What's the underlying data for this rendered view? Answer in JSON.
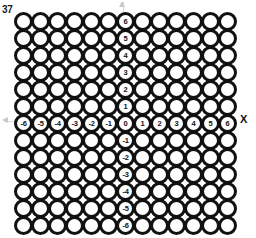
{
  "problem": {
    "number": "37"
  },
  "axes": {
    "x_label": "X",
    "y_label": "Y",
    "x_ticks": [
      "-6",
      "-5",
      "-4",
      "-3",
      "-2",
      "-1",
      "0",
      "1",
      "2",
      "3",
      "4",
      "5",
      "6"
    ],
    "y_ticks": [
      "6",
      "5",
      "4",
      "3",
      "2",
      "1",
      "0",
      "-1",
      "-2",
      "-3",
      "-4",
      "-5",
      "-6"
    ],
    "x_range": [
      -6,
      6
    ],
    "y_range": [
      -6,
      6
    ],
    "origin_label": "0",
    "arrow_color": "#c9c9c9",
    "line_color": "#d8d8d8"
  },
  "grid": {
    "columns": 13,
    "rows": 13,
    "cell_spacing_px": 17,
    "ring_diameter_px": 19,
    "ring_stroke_color": "#111111",
    "ring_fill_color": "#ffffff"
  },
  "chart_data": {
    "type": "scatter",
    "title": "",
    "xlabel": "X",
    "ylabel": "Y",
    "xlim": [
      -6.5,
      6.5
    ],
    "ylim": [
      -6.5,
      6.5
    ],
    "grid": true,
    "legend": "none",
    "categories": [
      "-6",
      "-5",
      "-4",
      "-3",
      "-2",
      "-1",
      "0",
      "1",
      "2",
      "3",
      "4",
      "5",
      "6"
    ],
    "values": [
      0,
      0,
      0,
      0,
      0,
      0,
      0,
      0,
      0,
      0,
      0,
      0,
      0
    ],
    "annotations": [
      "37"
    ]
  }
}
